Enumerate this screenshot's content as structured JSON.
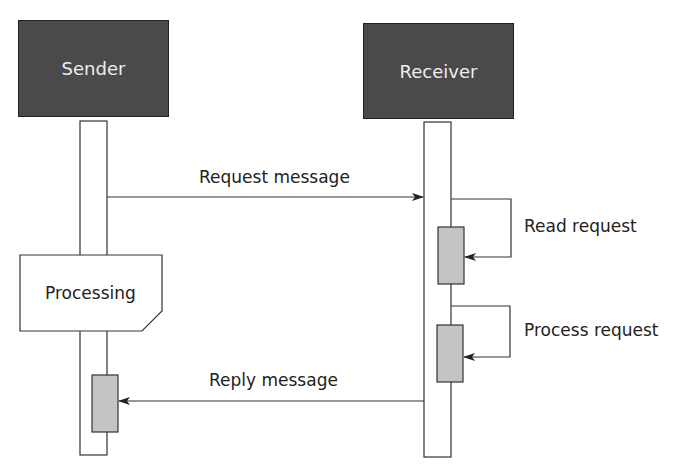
{
  "diagram": {
    "type": "sequence",
    "participants": [
      {
        "id": "sender",
        "label": "Sender"
      },
      {
        "id": "receiver",
        "label": "Receiver"
      }
    ],
    "messages": [
      {
        "from": "sender",
        "to": "receiver",
        "label": "Request message"
      },
      {
        "from": "receiver",
        "to": "receiver",
        "label": "Read request"
      },
      {
        "from": "receiver",
        "to": "receiver",
        "label": "Process request"
      },
      {
        "from": "receiver",
        "to": "sender",
        "label": "Reply message"
      }
    ],
    "note": {
      "attached_to": "sender",
      "label": "Processing"
    },
    "colors": {
      "actor_fill": "#4a4a4a",
      "activation_fill": "#c4c4c4",
      "line": "#333333"
    }
  }
}
